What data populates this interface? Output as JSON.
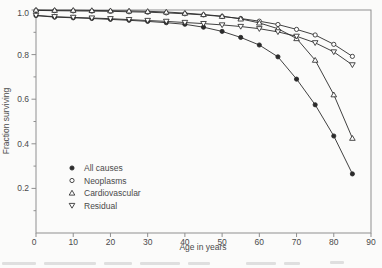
{
  "figure": {
    "background": "#fbfbfa",
    "frame_color": "#8f8f8f",
    "line_color": "#2b2b2b",
    "text_color": "#4a4a4a",
    "marker_fill_open": "#ffffff"
  },
  "chart_data": {
    "type": "line",
    "title": "",
    "xlabel": "Age in years",
    "ylabel": "Fraction surviving",
    "xlim": [
      0,
      90
    ],
    "ylim": [
      0,
      1.0
    ],
    "x_ticks": [
      0,
      10,
      20,
      30,
      40,
      50,
      60,
      70,
      80,
      90
    ],
    "x_tick_labels": [
      "0",
      "10",
      "20",
      "30",
      "40",
      "50",
      "60",
      "70",
      "80",
      "90"
    ],
    "y_major_ticks": [
      0.2,
      0.4,
      0.6,
      0.8,
      1.0
    ],
    "y_tick_labels": [
      "0.2",
      "0.4",
      "0.6",
      "0.8",
      "1.0"
    ],
    "y_minor_ticks": [
      0.1,
      0.3,
      0.5,
      0.7,
      0.9
    ],
    "grid": false,
    "legend_position": "inside-lower-left",
    "x": [
      0,
      5,
      10,
      15,
      20,
      25,
      30,
      35,
      40,
      45,
      50,
      55,
      60,
      65,
      70,
      75,
      80,
      85
    ],
    "series": [
      {
        "name": "All causes",
        "marker": "filled-circle",
        "values": [
          0.975,
          0.968,
          0.965,
          0.962,
          0.958,
          0.954,
          0.949,
          0.943,
          0.936,
          0.923,
          0.904,
          0.877,
          0.843,
          0.79,
          0.69,
          0.575,
          0.435,
          0.265
        ]
      },
      {
        "name": "Neoplasms",
        "marker": "open-circle",
        "values": [
          0.998,
          0.997,
          0.996,
          0.995,
          0.994,
          0.992,
          0.99,
          0.987,
          0.983,
          0.978,
          0.971,
          0.962,
          0.95,
          0.935,
          0.913,
          0.888,
          0.846,
          0.792
        ]
      },
      {
        "name": "Cardiovascular",
        "marker": "open-triangle-up",
        "values": [
          1.0,
          0.999,
          0.999,
          0.998,
          0.997,
          0.996,
          0.994,
          0.991,
          0.986,
          0.98,
          0.972,
          0.96,
          0.942,
          0.916,
          0.872,
          0.775,
          0.62,
          0.425
        ]
      },
      {
        "name": "Residual",
        "marker": "open-triangle-down",
        "values": [
          0.976,
          0.97,
          0.967,
          0.964,
          0.961,
          0.957,
          0.953,
          0.949,
          0.944,
          0.939,
          0.933,
          0.926,
          0.916,
          0.902,
          0.882,
          0.853,
          0.812,
          0.754
        ]
      }
    ]
  }
}
